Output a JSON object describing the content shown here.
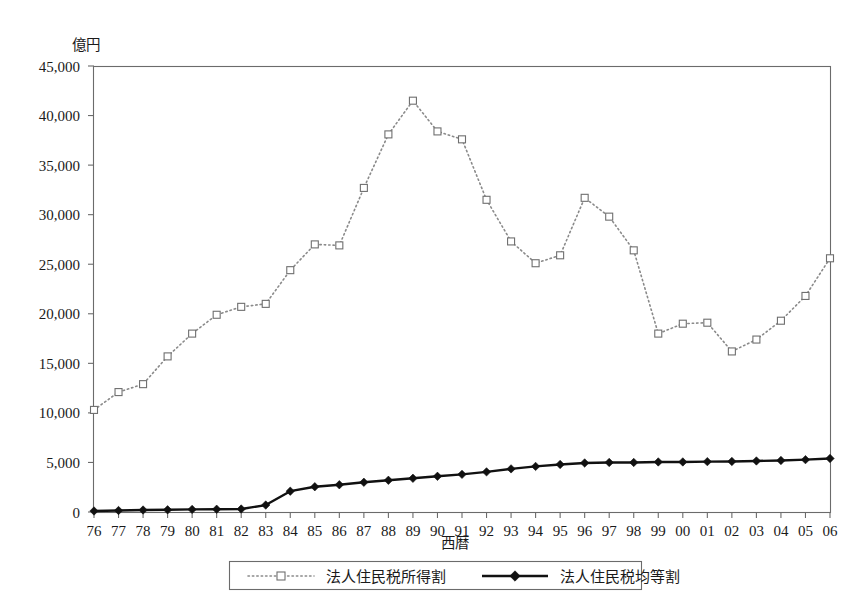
{
  "chart_data": {
    "type": "line",
    "title": "",
    "xlabel": "西暦",
    "ylabel": "億円",
    "xlim": [
      0,
      30
    ],
    "ylim": [
      0,
      45000
    ],
    "grid": false,
    "legend_position": "bottom",
    "categories": [
      "76",
      "77",
      "78",
      "79",
      "80",
      "81",
      "82",
      "83",
      "84",
      "85",
      "86",
      "87",
      "88",
      "89",
      "90",
      "91",
      "92",
      "93",
      "94",
      "95",
      "96",
      "97",
      "98",
      "99",
      "00",
      "01",
      "02",
      "03",
      "04",
      "05",
      "06"
    ],
    "ytick_labels": [
      "0",
      "5,000",
      "10,000",
      "15,000",
      "20,000",
      "25,000",
      "30,000",
      "35,000",
      "40,000",
      "45,000"
    ],
    "ytick_values": [
      0,
      5000,
      10000,
      15000,
      20000,
      25000,
      30000,
      35000,
      40000,
      45000
    ],
    "series": [
      {
        "name": "法人住民税所得割",
        "marker": "open-square",
        "line_style": "dotted",
        "color": "#8a8a8a",
        "values": [
          10300,
          12100,
          12900,
          15700,
          18000,
          19900,
          20700,
          21000,
          24400,
          27000,
          26900,
          32700,
          38100,
          41500,
          38400,
          37600,
          31500,
          27300,
          25100,
          25900,
          31700,
          29800,
          26400,
          18000,
          19000,
          19100,
          16200,
          17400,
          19300,
          21800,
          25600
        ]
      },
      {
        "name": "法人住民税均等割",
        "marker": "filled-diamond",
        "line_style": "solid",
        "color": "#111111",
        "values": [
          100,
          150,
          200,
          220,
          260,
          280,
          300,
          700,
          2100,
          2550,
          2750,
          3000,
          3200,
          3400,
          3600,
          3800,
          4050,
          4350,
          4600,
          4800,
          4950,
          5000,
          5000,
          5050,
          5050,
          5080,
          5100,
          5150,
          5200,
          5280,
          5400
        ]
      }
    ]
  },
  "legend": {
    "entries": [
      {
        "label": "法人住民税所得割",
        "marker": "open-square",
        "style": "dotted"
      },
      {
        "label": "法人住民税均等割",
        "marker": "filled-diamond",
        "style": "solid"
      }
    ]
  }
}
